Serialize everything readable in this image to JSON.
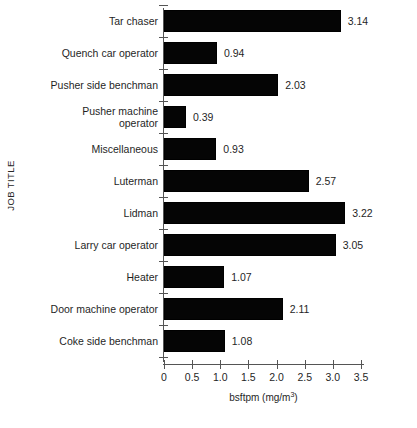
{
  "chart_data": {
    "type": "bar",
    "orientation": "horizontal",
    "title": "",
    "xlabel": "bsftpm (mg/m3)",
    "xlabel_base": "bsftpm (mg/m",
    "xlabel_sup": "3",
    "xlabel_tail": ")",
    "ylabel": "JOB TITLE",
    "categories": [
      "Tar chaser",
      "Quench car operator",
      "Pusher side benchman",
      "Pusher machine\noperator",
      "Miscellaneous",
      "Luterman",
      "Lidman",
      "Larry car operator",
      "Heater",
      "Door machine operator",
      "Coke side benchman"
    ],
    "values": [
      3.14,
      0.94,
      2.03,
      0.39,
      0.93,
      2.57,
      3.22,
      3.05,
      1.07,
      2.11,
      1.08
    ],
    "value_labels": [
      "3.14",
      "0.94",
      "2.03",
      "0.39",
      "0.93",
      "2.57",
      "3.22",
      "3.05",
      "1.07",
      "2.11",
      "1.08"
    ],
    "xlim": [
      0,
      3.5
    ],
    "xticks": [
      0,
      0.5,
      1.0,
      1.5,
      2.0,
      2.5,
      3.0,
      3.5
    ],
    "xtick_labels": [
      "0",
      "0.5",
      "1.0",
      "1.5",
      "2.0",
      "2.5",
      "3.0",
      "3.5"
    ],
    "grid": false,
    "legend": null,
    "bar_color": "#050505",
    "axis_color": "#555555",
    "background": "#ffffff"
  }
}
